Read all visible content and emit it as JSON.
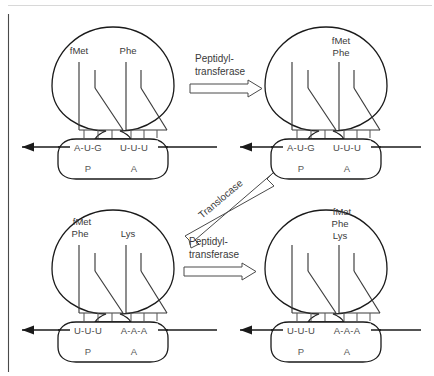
{
  "figure": {
    "background_color": "#ffffff",
    "line_color": "#1a1a1a",
    "text_color": "#3a3a3a"
  },
  "panels": [
    {
      "id": "top-left",
      "position": "top-left",
      "trna_labels": [
        {
          "text": "fMet",
          "site": "P"
        },
        {
          "text": "Phe",
          "site": "A"
        }
      ],
      "mrna_codons": [
        "A-U-G",
        "U-U-U"
      ],
      "mrna_text": "A-U-G—U-U-U",
      "site_labels": [
        "P",
        "A"
      ]
    },
    {
      "id": "top-right",
      "position": "top-right",
      "trna_labels": [
        {
          "text": "",
          "site": "P"
        },
        {
          "text": "fMet\nPhe",
          "site": "A"
        }
      ],
      "a_site_stack": [
        "fMet",
        "Phe"
      ],
      "mrna_codons": [
        "A-U-G",
        "U-U-U"
      ],
      "mrna_text": "A-U-G—U-U-U",
      "site_labels": [
        "P",
        "A"
      ]
    },
    {
      "id": "bottom-left",
      "position": "bottom-left",
      "trna_labels": [
        {
          "text": "fMet\nPhe",
          "site": "P"
        },
        {
          "text": "Lys",
          "site": "A"
        }
      ],
      "p_site_stack": [
        "fMet",
        "Phe"
      ],
      "a_site_stack": [
        "Lys"
      ],
      "mrna_codons": [
        "U-U-U",
        "A-A-A"
      ],
      "mrna_text": "U-U-U—A-A-A",
      "site_labels": [
        "P",
        "A"
      ]
    },
    {
      "id": "bottom-right",
      "position": "bottom-right",
      "trna_labels": [
        {
          "text": "",
          "site": "P"
        },
        {
          "text": "fMet\nPhe\nLys",
          "site": "A"
        }
      ],
      "a_site_stack": [
        "fMet",
        "Phe",
        "Lys"
      ],
      "mrna_codons": [
        "U-U-U",
        "A-A-A"
      ],
      "mrna_text": "U-U-U—A-A-A",
      "site_labels": [
        "P",
        "A"
      ]
    }
  ],
  "labels": {
    "fmet": "fMet",
    "phe": "Phe",
    "lys": "Lys",
    "site_p": "P",
    "site_a": "A"
  },
  "mrna": {
    "top_codon_1": "A-U-G",
    "top_codon_2": "U-U-U",
    "bottom_codon_1": "U-U-U",
    "bottom_codon_2": "A-A-A",
    "separator": "—"
  },
  "arrows": [
    {
      "id": "arrow-top-peptidyl",
      "label_line1": "Peptidyl-",
      "label_line2": "transferase",
      "direction": "right",
      "between": [
        "top-left",
        "top-right"
      ]
    },
    {
      "id": "arrow-translocase",
      "label_line1": "Translocase",
      "label_line2": "",
      "direction": "down-left-diagonal",
      "between": [
        "top-right",
        "bottom-left"
      ]
    },
    {
      "id": "arrow-bottom-peptidyl",
      "label_line1": "Peptidyl-",
      "label_line2": "transferase",
      "direction": "right",
      "between": [
        "bottom-left",
        "bottom-right"
      ]
    }
  ],
  "enzymes": {
    "peptidyl_transferase_line1": "Peptidyl-",
    "peptidyl_transferase_line2": "transferase",
    "translocase": "Translocase"
  }
}
